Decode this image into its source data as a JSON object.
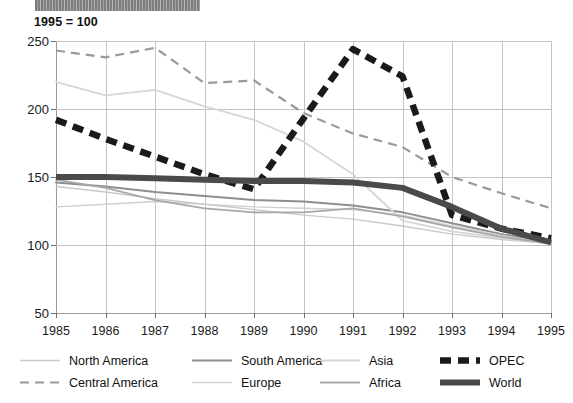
{
  "banner": {
    "text": "",
    "note": "illegible cropped dark title bar"
  },
  "index_note": "1995 = 100",
  "chart_data": {
    "type": "line",
    "title": "",
    "subtitle": "1995 = 100",
    "xlabel": "",
    "ylabel": "",
    "xlim": [
      1985,
      1995
    ],
    "ylim": [
      50,
      250
    ],
    "grid": true,
    "legend_position": "bottom",
    "x": [
      1985,
      1986,
      1987,
      1988,
      1989,
      1990,
      1991,
      1992,
      1993,
      1994,
      1995
    ],
    "categories": [
      "1985",
      "1986",
      "1987",
      "1988",
      "1989",
      "1990",
      "1991",
      "1992",
      "1993",
      "1994",
      "1995"
    ],
    "yticks": [
      50,
      100,
      150,
      200,
      250
    ],
    "series": [
      {
        "name": "North America",
        "color": "#c9c9c9",
        "style": "dotted-thin",
        "values": [
          143,
          139,
          134,
          130,
          126,
          122,
          119,
          114,
          108,
          104,
          101
        ]
      },
      {
        "name": "Central America",
        "color": "#9a9a9a",
        "style": "dashed",
        "values": [
          243,
          238,
          245,
          219,
          221,
          197,
          182,
          172,
          150,
          138,
          127
        ]
      },
      {
        "name": "South America",
        "color": "#8e8e8e",
        "style": "solid-medium",
        "values": [
          146,
          143,
          139,
          136,
          133,
          132,
          129,
          124,
          116,
          108,
          102
        ]
      },
      {
        "name": "Europe",
        "color": "#cfcfcf",
        "style": "dotted-thin",
        "values": [
          128,
          130,
          132,
          130,
          128,
          127,
          126,
          122,
          114,
          107,
          101
        ]
      },
      {
        "name": "Asia",
        "color": "#d6d6d6",
        "style": "solid-light",
        "values": [
          220,
          210,
          214,
          202,
          192,
          176,
          152,
          118,
          110,
          105,
          101
        ]
      },
      {
        "name": "Africa",
        "color": "#a8a8a8",
        "style": "solid-light-medium",
        "values": [
          148,
          142,
          133,
          127,
          124,
          124,
          127,
          121,
          113,
          106,
          101
        ]
      },
      {
        "name": "OPEC",
        "color": "#1a1a1a",
        "style": "heavy-dashed",
        "values": [
          192,
          178,
          165,
          152,
          141,
          193,
          244,
          224,
          122,
          112,
          105
        ]
      },
      {
        "name": "World",
        "color": "#4a4a4a",
        "style": "heavy-solid",
        "values": [
          150,
          150,
          149,
          148,
          147,
          147,
          146,
          142,
          128,
          112,
          102
        ]
      }
    ]
  },
  "legend": {
    "items": [
      {
        "label": "North America",
        "series": 0,
        "col": 0,
        "row": 0
      },
      {
        "label": "Central America",
        "series": 1,
        "col": 0,
        "row": 1
      },
      {
        "label": "South America",
        "series": 2,
        "col": 1,
        "row": 0
      },
      {
        "label": "Europe",
        "series": 3,
        "col": 1,
        "row": 1
      },
      {
        "label": "Asia",
        "series": 4,
        "col": 2,
        "row": 0
      },
      {
        "label": "Africa",
        "series": 5,
        "col": 2,
        "row": 1
      },
      {
        "label": "OPEC",
        "series": 6,
        "col": 3,
        "row": 0
      },
      {
        "label": "World",
        "series": 7,
        "col": 3,
        "row": 1
      }
    ]
  }
}
